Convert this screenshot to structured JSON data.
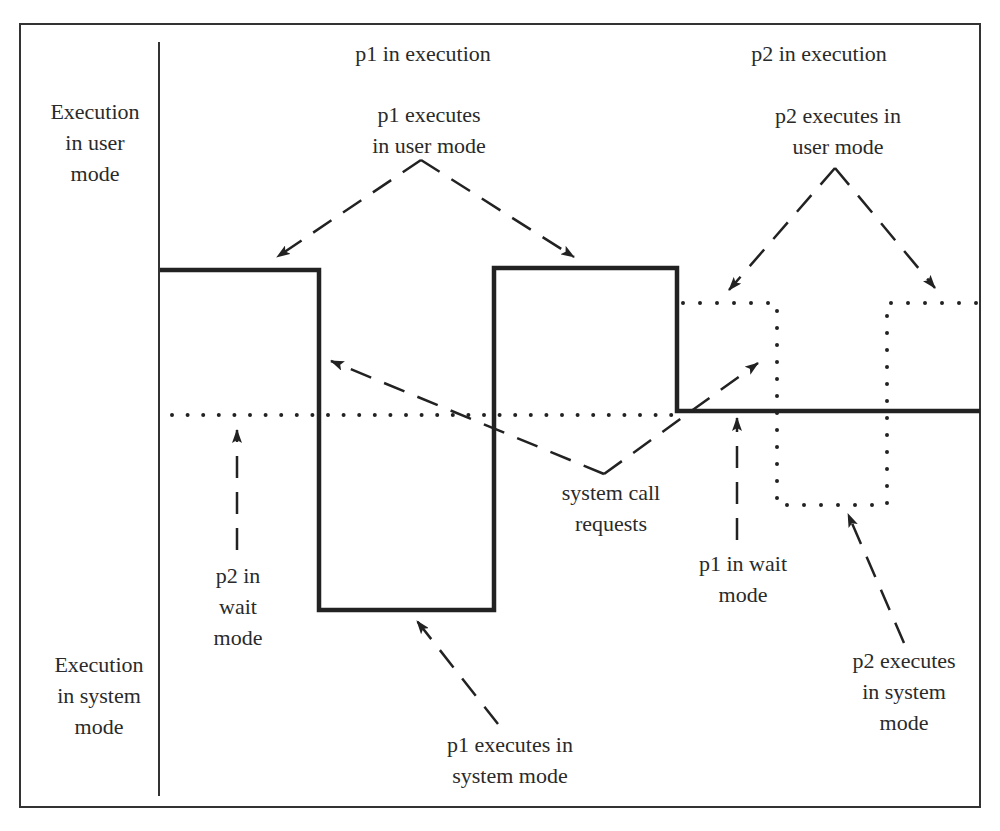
{
  "diagram": {
    "type": "mode-switching timing diagram",
    "axis_labels": {
      "user_mode": [
        "Execution",
        "in user",
        "mode"
      ],
      "system_mode": [
        "Execution",
        "in system",
        "mode"
      ]
    },
    "headers": {
      "p1": "p1 in execution",
      "p2": "p2 in execution"
    },
    "annotations": {
      "p1_user": [
        "p1 executes",
        "in user mode"
      ],
      "p2_user": [
        "p2 executes in",
        "user mode"
      ],
      "system_calls": [
        "system call",
        "requests"
      ],
      "p2_wait": [
        "p2 in",
        "wait",
        "mode"
      ],
      "p1_wait": [
        "p1 in wait",
        "mode"
      ],
      "p1_system": [
        "p1 executes in",
        "system mode"
      ],
      "p2_system": [
        "p2 executes",
        "in system",
        "mode"
      ]
    },
    "traces": {
      "p1": {
        "style": "solid",
        "color": "#222222",
        "points": [
          [
            160,
            270
          ],
          [
            319,
            270
          ],
          [
            319,
            610
          ],
          [
            494,
            610
          ],
          [
            494,
            268
          ],
          [
            677,
            268
          ],
          [
            677,
            411
          ],
          [
            980,
            411
          ]
        ]
      },
      "p2_wait": {
        "style": "dotted",
        "color": "#222222",
        "points": [
          [
            172,
            415
          ],
          [
            677,
            415
          ]
        ]
      },
      "p2": {
        "style": "dotted",
        "color": "#222222",
        "points": [
          [
            683,
            303
          ],
          [
            777,
            303
          ],
          [
            777,
            505
          ],
          [
            887,
            505
          ],
          [
            887,
            303
          ],
          [
            978,
            303
          ]
        ]
      }
    }
  }
}
